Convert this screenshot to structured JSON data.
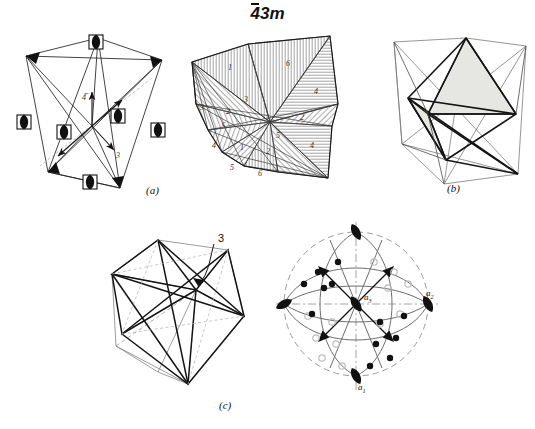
{
  "figure": {
    "title_overbar": "4",
    "title_rest": "3m",
    "title_full": "-43m",
    "point_group": "4̅3m"
  },
  "captions": {
    "a": "(a)",
    "b": "(b)",
    "c": "(c)"
  },
  "panel_a": {
    "name": "tetrahedron-symmetry-elements",
    "symbols": [
      {
        "type": "4bar-axis",
        "label": "4̅"
      },
      {
        "type": "3-fold-axis",
        "label": "3"
      },
      {
        "type": "mirror-plane",
        "label": "m"
      }
    ],
    "axis_marks": [
      "4̅",
      "3"
    ]
  },
  "panel_a2": {
    "name": "general-form-hatched-tetrahedron",
    "sector_labels": [
      "1",
      "6",
      "3",
      "4",
      "2",
      "5",
      "2",
      "1",
      "4",
      "5",
      "6",
      "4",
      "3",
      "2",
      "1"
    ],
    "sectors": [
      {
        "id": "s1",
        "label": "1"
      },
      {
        "id": "s6",
        "label": "6"
      },
      {
        "id": "s3",
        "label": "3"
      },
      {
        "id": "s4",
        "label": "4"
      },
      {
        "id": "s2",
        "label": "2"
      },
      {
        "id": "s5",
        "label": "5"
      },
      {
        "id": "s2b",
        "label": "2"
      },
      {
        "id": "s1b",
        "label": "1"
      },
      {
        "id": "s4b",
        "label": "4"
      },
      {
        "id": "s5b",
        "label": "5"
      },
      {
        "id": "s6b",
        "label": "6"
      },
      {
        "id": "s3b",
        "label": "3"
      }
    ]
  },
  "panel_b": {
    "name": "inner-tetrahedron-shaded",
    "shade_color": "#e6e6e3"
  },
  "panel_c1": {
    "name": "cube-with-inscribed-polyhedron",
    "label_3": "3"
  },
  "panel_c2": {
    "name": "stereographic-projection",
    "axis_labels": {
      "a1": {
        "base": "a",
        "sub": "1"
      },
      "a2": {
        "base": "a",
        "sub": "2"
      },
      "a3": {
        "base": "a",
        "sub": "3"
      }
    },
    "symbols": [
      {
        "type": "4bar-axis",
        "count": 3
      },
      {
        "type": "3-fold-axis",
        "count": 4
      },
      {
        "type": "upper-pole",
        "marker": "filled-circle",
        "count": 12
      },
      {
        "type": "lower-pole",
        "marker": "open-circle",
        "count": 12
      }
    ]
  },
  "colors": {
    "ink": "#111111",
    "line_light": "#6a6a6a",
    "shade": "#e6e6e3",
    "hatch": "#8a8a8a",
    "open_circle": "#b9b9b9"
  }
}
